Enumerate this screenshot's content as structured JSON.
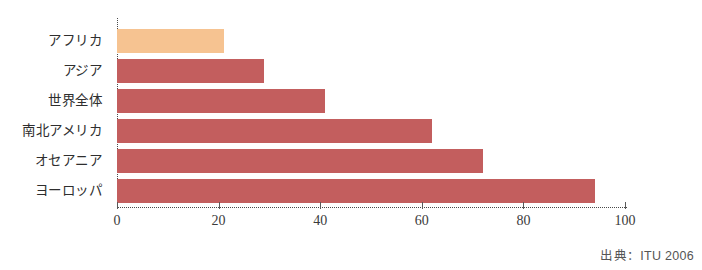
{
  "chart_data": {
    "type": "bar",
    "orientation": "horizontal",
    "title": "",
    "subtitle": "",
    "xlabel": "",
    "ylabel": "",
    "categories": [
      "アフリカ",
      "アジア",
      "世界全体",
      "南北アメリカ",
      "オセアニア",
      "ヨーロッパ"
    ],
    "values": [
      21,
      29,
      41,
      62,
      72,
      94
    ],
    "xlim": [
      0,
      100
    ],
    "tick_labels": [
      "0",
      "20",
      "40",
      "60",
      "80",
      "100"
    ],
    "ticks": [
      0,
      20,
      40,
      60,
      80,
      100
    ],
    "grid": false,
    "legend": "none",
    "bar_colors": [
      "#f6c391",
      "#c35e5e",
      "#c35e5e",
      "#c35e5e",
      "#c35e5e",
      "#c35e5e"
    ],
    "axis_style": "dotted",
    "axis_color": "#4a4a4a"
  },
  "source": {
    "text": "出典：ITU 2006"
  }
}
